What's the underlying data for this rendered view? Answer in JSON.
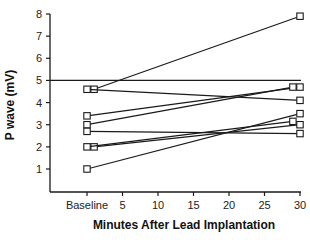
{
  "chart_data": {
    "type": "line",
    "title": "",
    "xlabel": "Minutes After Lead Implantation",
    "ylabel": "P wave (mV)",
    "xlim": [
      -2,
      30
    ],
    "ylim": [
      0,
      8
    ],
    "x_ticks": [
      {
        "value": 0,
        "label": "Baseline"
      },
      {
        "value": 5,
        "label": "5"
      },
      {
        "value": 10,
        "label": "10"
      },
      {
        "value": 15,
        "label": "15"
      },
      {
        "value": 20,
        "label": "20"
      },
      {
        "value": 25,
        "label": "25"
      },
      {
        "value": 30,
        "label": "30"
      }
    ],
    "y_ticks": [
      1,
      2,
      3,
      4,
      5,
      6,
      7,
      8
    ],
    "grid": false,
    "legend": null,
    "reference_line": {
      "y": 5.0,
      "x_range": [
        -2,
        30
      ]
    },
    "marker": "open-square",
    "series": [
      {
        "name": "Patient 1",
        "x": [
          1,
          30
        ],
        "y": [
          4.6,
          7.9
        ]
      },
      {
        "name": "Patient 2",
        "x": [
          0,
          30
        ],
        "y": [
          4.6,
          4.1
        ]
      },
      {
        "name": "Patient 3",
        "x": [
          0,
          30
        ],
        "y": [
          3.4,
          4.7
        ]
      },
      {
        "name": "Patient 4",
        "x": [
          0,
          29
        ],
        "y": [
          3.0,
          4.7
        ]
      },
      {
        "name": "Patient 5",
        "x": [
          0,
          30
        ],
        "y": [
          2.7,
          2.6
        ]
      },
      {
        "name": "Patient 6",
        "x": [
          1,
          30
        ],
        "y": [
          2.0,
          3.0
        ]
      },
      {
        "name": "Patient 7",
        "x": [
          0,
          29
        ],
        "y": [
          2.0,
          3.15
        ]
      },
      {
        "name": "Patient 8",
        "x": [
          0,
          30
        ],
        "y": [
          1.0,
          3.5
        ]
      }
    ]
  },
  "colors": {
    "line": "#1a1a1a",
    "background": "#ffffff"
  }
}
